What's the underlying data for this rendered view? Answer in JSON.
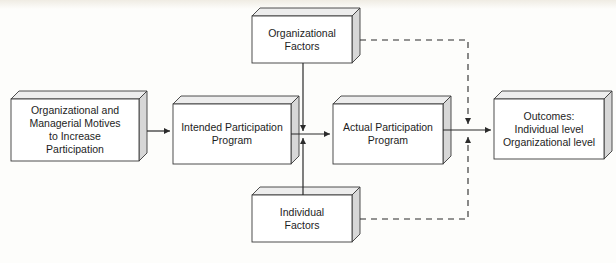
{
  "diagram": {
    "type": "flowchart",
    "title": "",
    "style": {
      "background": "#fdfdfb",
      "box_face": "#ffffff",
      "box_side": "#d7d7d7",
      "box_top": "#e8e8e8",
      "stroke": "#3a3a3a",
      "text": "#1d1d1d"
    },
    "nodes": [
      {
        "id": "motives",
        "lines": [
          "Organizational and",
          "Managerial Motives",
          "to Increase",
          "Participation"
        ],
        "x": 11,
        "y": 99,
        "w": 128,
        "h": 62
      },
      {
        "id": "intended",
        "lines": [
          "Intended Participation",
          "Program"
        ],
        "x": 173,
        "y": 104,
        "w": 118,
        "h": 52
      },
      {
        "id": "actual",
        "lines": [
          "Actual Participation",
          "Program"
        ],
        "x": 333,
        "y": 104,
        "w": 110,
        "h": 52
      },
      {
        "id": "outcomes",
        "lines": [
          "Outcomes:",
          "Individual level",
          "Organizational level"
        ],
        "x": 494,
        "y": 99,
        "w": 110,
        "h": 60
      },
      {
        "id": "org-factors",
        "lines": [
          "Organizational",
          "Factors"
        ],
        "x": 252,
        "y": 16,
        "w": 100,
        "h": 47
      },
      {
        "id": "ind-factors",
        "lines": [
          "Individual",
          "Factors"
        ],
        "x": 252,
        "y": 195,
        "w": 100,
        "h": 47
      }
    ],
    "edges": [
      {
        "id": "motives-to-intended",
        "from": "motives",
        "to": "intended",
        "style": "solid",
        "arrow": true
      },
      {
        "id": "intended-to-actual",
        "from": "intended",
        "to": "actual",
        "style": "solid",
        "arrow": true
      },
      {
        "id": "actual-to-outcomes",
        "from": "actual",
        "to": "outcomes",
        "style": "solid",
        "arrow": true
      },
      {
        "id": "org-factors-to-flow",
        "from": "org-factors",
        "to": "intended-actual-link",
        "style": "solid",
        "arrow": true
      },
      {
        "id": "ind-factors-to-flow",
        "from": "ind-factors",
        "to": "intended-actual-link",
        "style": "solid",
        "arrow": true
      },
      {
        "id": "org-factors-feedback",
        "from": "org-factors",
        "to": "actual-outcomes-link",
        "style": "dashed",
        "arrow": true
      },
      {
        "id": "ind-factors-feedback",
        "from": "ind-factors",
        "to": "actual-outcomes-link",
        "style": "dashed",
        "arrow": true
      }
    ]
  }
}
